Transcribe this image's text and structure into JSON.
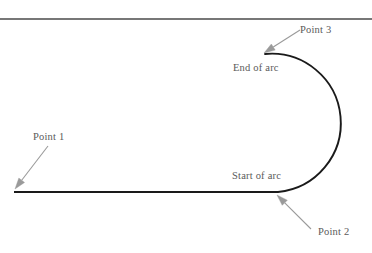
{
  "figure": {
    "background_color": "#ffffff",
    "stroke_color": "#1a1a1a",
    "leader_color": "#9a9a9a",
    "text_color": "#5a5a5a",
    "rule_color": "#4a4a4a",
    "labels": {
      "point1": "Point 1",
      "point2": "Point 2",
      "point3": "Point 3",
      "start_of_arc": "Start of arc",
      "end_of_arc": "End of arc"
    }
  },
  "chart_data": {
    "type": "line",
    "xlabel": "",
    "ylabel": "",
    "xlim": [
      0,
      372
    ],
    "ylim": [
      253,
      0
    ],
    "grid": false,
    "legend": "none",
    "series": [
      {
        "name": "straight-segment",
        "kind": "polyline",
        "points": [
          [
            14,
            192
          ],
          [
            278,
            192
          ]
        ]
      },
      {
        "name": "semicircular-arc",
        "kind": "arc",
        "center": [
          272,
          123
        ],
        "radius": 60,
        "start_point": [
          278,
          192
        ],
        "end_point": [
          265,
          54
        ],
        "sweep": "clockwise-right-bulge",
        "rightmost_x": 332
      }
    ],
    "annotations": [
      {
        "text": "Point 1",
        "text_xy": [
          33,
          131
        ],
        "leader_from": [
          48,
          146
        ],
        "leader_to": [
          15,
          189
        ],
        "arrowhead": "at-leader-to"
      },
      {
        "text": "Point 2",
        "text_xy": [
          318,
          226
        ],
        "leader_from": [
          311,
          229
        ],
        "leader_to": [
          277,
          195
        ],
        "arrowhead": "at-leader-to"
      },
      {
        "text": "Point 3",
        "text_xy": [
          300,
          24
        ],
        "leader_from": [
          300,
          30
        ],
        "leader_to": [
          264,
          53
        ],
        "arrowhead": "at-leader-to"
      },
      {
        "text": "Start of arc",
        "text_xy": [
          232,
          170
        ],
        "leader_from": null,
        "leader_to": null,
        "arrowhead": "none"
      },
      {
        "text": "End of arc",
        "text_xy": [
          233,
          62
        ],
        "leader_from": null,
        "leader_to": null,
        "arrowhead": "none"
      }
    ],
    "decorations": [
      {
        "name": "top-horizontal-rule",
        "kind": "hline",
        "y": 19,
        "x_range": [
          0,
          372
        ]
      }
    ]
  }
}
